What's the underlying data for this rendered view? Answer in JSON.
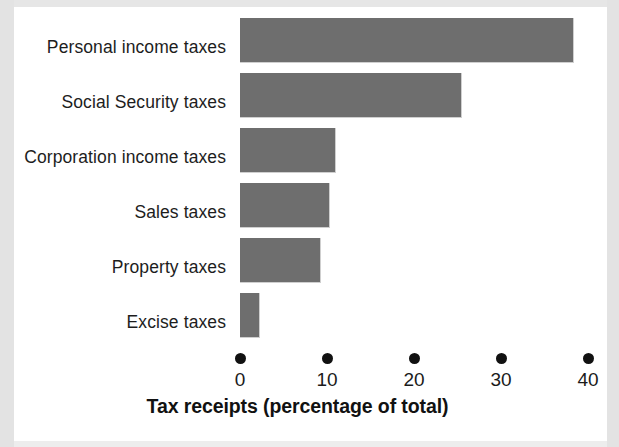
{
  "chart_data": {
    "type": "bar",
    "orientation": "horizontal",
    "title": "",
    "xlabel": "Tax receipts (percentage of total)",
    "ylabel": "",
    "categories": [
      "Personal income taxes",
      "Social Security taxes",
      "Corporation income taxes",
      "Sales taxes",
      "Property taxes",
      "Excise taxes"
    ],
    "values": [
      38.3,
      25.4,
      10.9,
      10.2,
      9.2,
      2.2
    ],
    "xlim": [
      0,
      40
    ],
    "xticks": [
      0,
      10,
      20,
      30,
      40
    ],
    "xtick_labels": [
      "0",
      "10",
      "20",
      "30",
      "40"
    ],
    "grid": false,
    "legend": null,
    "bar_color": "#6e6e6e",
    "tick_marker_style": "filled-circle",
    "background_color": "#ffffff"
  },
  "axis": {
    "title": "Tax receipts (percentage of total)",
    "ticks": [
      {
        "label": "0",
        "value": 0
      },
      {
        "label": "10",
        "value": 10
      },
      {
        "label": "20",
        "value": 20
      },
      {
        "label": "30",
        "value": 30
      },
      {
        "label": "40",
        "value": 40
      }
    ]
  },
  "bars": [
    {
      "label": "Personal income taxes",
      "value": 38.3
    },
    {
      "label": "Social Security taxes",
      "value": 25.4
    },
    {
      "label": "Corporation income taxes",
      "value": 10.9
    },
    {
      "label": "Sales taxes",
      "value": 10.2
    },
    {
      "label": "Property taxes",
      "value": 9.2
    },
    {
      "label": "Excise taxes",
      "value": 2.2
    }
  ]
}
